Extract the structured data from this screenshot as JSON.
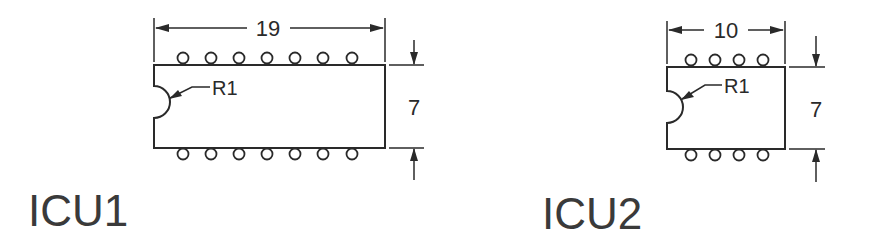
{
  "components": [
    {
      "name": "ICU1",
      "width_dim": "19",
      "height_dim": "7",
      "notch_label": "R1",
      "pins_per_side": 7
    },
    {
      "name": "ICU2",
      "width_dim": "10",
      "height_dim": "7",
      "notch_label": "R1",
      "pins_per_side": 4
    }
  ]
}
